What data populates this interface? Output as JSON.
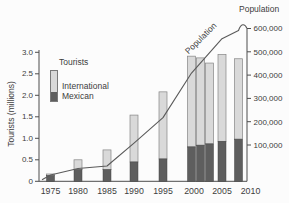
{
  "chart_data": {
    "type": "bar",
    "subtype": "stacked-bar-with-line",
    "title": "",
    "categories": [
      "1975",
      "1980",
      "1985",
      "1990",
      "1995",
      "2000",
      "2001",
      "2002",
      "2005",
      "2008"
    ],
    "series": [
      {
        "name": "Mexican",
        "role": "bar-bottom-segment",
        "color": "#5e5e5e",
        "values": [
          0.13,
          0.27,
          0.27,
          0.45,
          0.52,
          0.8,
          0.84,
          0.87,
          0.93,
          0.98
        ]
      },
      {
        "name": "International",
        "role": "bar-top-segment",
        "color": "#d9d9d9",
        "values": [
          0.04,
          0.23,
          0.46,
          1.09,
          1.56,
          2.11,
          2.03,
          1.88,
          2.02,
          1.87
        ]
      }
    ],
    "line_series": {
      "name": "Population",
      "color": "#5a5a5a",
      "x": [
        "1975",
        "1980",
        "1985",
        "1990",
        "1995",
        "2000",
        "2005",
        "2008"
      ],
      "values": [
        25000,
        50000,
        60000,
        150000,
        250000,
        425000,
        560000,
        600000
      ]
    },
    "left_axis": {
      "title": "Tourists (millions)",
      "tick_labels": [
        "3.0",
        "2.5",
        "2.0",
        "1.5",
        "1.0",
        "0.5",
        "0"
      ],
      "range": [
        0,
        3.0
      ]
    },
    "right_axis": {
      "title": "Population",
      "tick_labels": [
        "600,000",
        "500,000",
        "400,000",
        "300,000",
        "200,000",
        "100,000"
      ],
      "range": [
        0,
        600000
      ]
    },
    "x_axis": {
      "tick_labels": [
        "1975",
        "1980",
        "1985",
        "1990",
        "1995",
        "2000",
        "2005",
        "2010"
      ]
    },
    "legend": {
      "title": "Tourists",
      "items": [
        {
          "label": "International",
          "color": "#d9d9d9"
        },
        {
          "label": "Mexican",
          "color": "#5e5e5e"
        }
      ]
    },
    "annotations": [
      {
        "text": "Population",
        "rotation_deg": -45,
        "position": "along-line"
      }
    ],
    "grid": false,
    "legend_position": "upper-left-inside"
  }
}
